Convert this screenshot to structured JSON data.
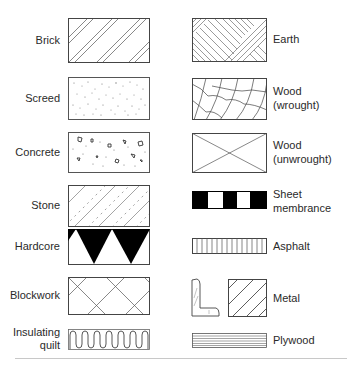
{
  "figure": {
    "type": "material hatching legend",
    "line_color": "#444444",
    "fill_color": "#000000"
  },
  "left_column": [
    {
      "id": "brick",
      "label": "Brick",
      "pattern": "widely spaced pairs of diagonal lines"
    },
    {
      "id": "screed",
      "label": "Screed",
      "pattern": "fine stippled dots"
    },
    {
      "id": "concrete",
      "label": "Concrete",
      "pattern": "dots with small aggregate stones"
    },
    {
      "id": "stone",
      "label": "Stone",
      "pattern": "diagonal lines with short dashes"
    },
    {
      "id": "hardcore",
      "label": "Hardcore",
      "pattern": "black inverted triangles"
    },
    {
      "id": "blockwork",
      "label": "Blockwork",
      "pattern": "diagonal cross-hatch grid"
    },
    {
      "id": "insulating-quilt",
      "label_line1": "Insulating",
      "label_line2": "quilt",
      "pattern": "wavy serpentine line"
    }
  ],
  "right_column": [
    {
      "id": "earth",
      "label": "Earth",
      "pattern": "alternating diagonal hatch bands"
    },
    {
      "id": "wood-wrought",
      "label_line1": "Wood",
      "label_line2": "(wrought)",
      "pattern": "curved grain lines"
    },
    {
      "id": "wood-unwrought",
      "label_line1": "Wood",
      "label_line2": "(unwrought)",
      "pattern": "diagonal cross (X)"
    },
    {
      "id": "sheet-membrance",
      "label_line1": "Sheet",
      "label_line2": "membrance",
      "pattern": "alternating black and white blocks"
    },
    {
      "id": "asphalt",
      "label": "Asphalt",
      "pattern": "vertical lines"
    },
    {
      "id": "metal",
      "label": "Metal",
      "pattern": "angle section and diagonal hatched square"
    },
    {
      "id": "plywood",
      "label": "Plywood",
      "pattern": "horizontal laminated lines"
    }
  ]
}
